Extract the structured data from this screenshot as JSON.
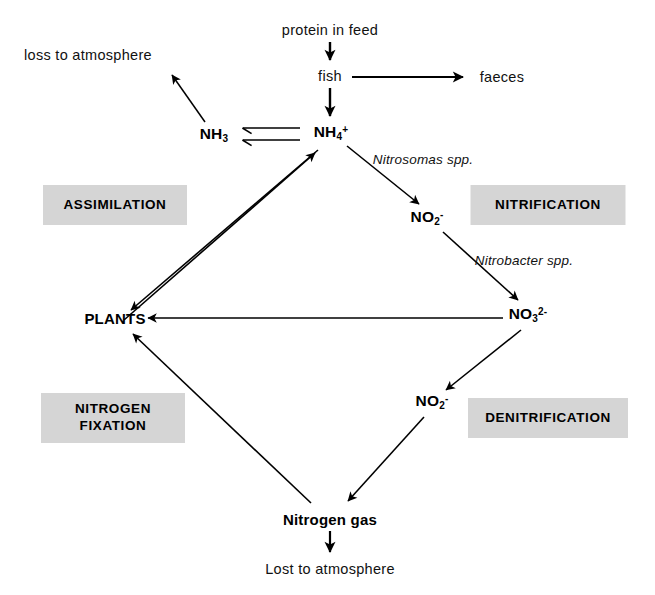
{
  "diagram": {
    "canvas": {
      "width": 655,
      "height": 595
    },
    "colors": {
      "background": "#ffffff",
      "stroke": "#000000",
      "tag_background": "#d5d5d5",
      "text": "#000000"
    },
    "nodes": [
      {
        "id": "protein",
        "label": "protein in feed",
        "x": 330,
        "y": 30,
        "style": "plain"
      },
      {
        "id": "fish",
        "label": "fish",
        "x": 330,
        "y": 76,
        "style": "plain"
      },
      {
        "id": "faeces",
        "label": "faeces",
        "x": 502,
        "y": 77,
        "style": "plain"
      },
      {
        "id": "loss",
        "label": "loss to atmosphere",
        "x": 88,
        "y": 55,
        "style": "plain"
      },
      {
        "id": "nh3",
        "label": "NH3",
        "x": 214,
        "y": 135,
        "style": "chem",
        "sub": "3",
        "sup": ""
      },
      {
        "id": "nh4",
        "label": "NH4+",
        "x": 331,
        "y": 133,
        "style": "chem",
        "sub": "4",
        "sup": "+"
      },
      {
        "id": "no2_top",
        "label": "NO2-",
        "x": 427,
        "y": 218,
        "style": "chem",
        "sub": "2",
        "sup": "-"
      },
      {
        "id": "no3",
        "label": "NO3 2-",
        "x": 528,
        "y": 315,
        "style": "chem",
        "sub": "3",
        "sup": "2-"
      },
      {
        "id": "no2_bottom",
        "label": "NO2-",
        "x": 432,
        "y": 402,
        "style": "chem",
        "sub": "2",
        "sup": "-"
      },
      {
        "id": "plants",
        "label": "PLANTS",
        "x": 115,
        "y": 318,
        "style": "bold"
      },
      {
        "id": "nitrogen_gas",
        "label": "Nitrogen gas",
        "x": 330,
        "y": 519,
        "style": "bold"
      },
      {
        "id": "lost",
        "label": "Lost to atmosphere",
        "x": 330,
        "y": 569,
        "style": "plain"
      }
    ],
    "edge_labels": [
      {
        "id": "nitrosomas",
        "text": "Nitrosomas spp.",
        "x": 423,
        "y": 159
      },
      {
        "id": "nitrobacter",
        "text": "Nitrobacter spp.",
        "x": 524,
        "y": 260
      }
    ],
    "tags": [
      {
        "id": "assimilation",
        "text": "ASSIMILATION",
        "x": 115,
        "y": 205,
        "w": 144,
        "h": 40
      },
      {
        "id": "nitrification",
        "text": "NITRIFICATION",
        "x": 548,
        "y": 205,
        "w": 155,
        "h": 40
      },
      {
        "id": "nitrogen-fixation",
        "text": "NITROGEN\nFIXATION",
        "x": 113,
        "y": 418,
        "w": 144,
        "h": 50
      },
      {
        "id": "denitrification",
        "text": "DENITRIFICATION",
        "x": 548,
        "y": 418,
        "w": 160,
        "h": 40
      }
    ],
    "edges": [
      {
        "id": "protein-to-fish",
        "from": "protein",
        "to": "fish",
        "kind": "arrow",
        "weight": "thick"
      },
      {
        "id": "fish-to-faeces",
        "from": "fish",
        "to": "faeces",
        "kind": "arrow",
        "weight": "thick"
      },
      {
        "id": "fish-to-nh4",
        "from": "fish",
        "to": "nh4",
        "kind": "arrow",
        "weight": "thick"
      },
      {
        "id": "nh3-to-loss",
        "from": "nh3",
        "to": "loss",
        "kind": "arrow",
        "weight": "thin"
      },
      {
        "id": "nh4-to-nh3",
        "from": "nh4",
        "to": "nh3",
        "kind": "arrow",
        "weight": "thin"
      },
      {
        "id": "nh3-to-nh4",
        "from": "nh3",
        "to": "nh4",
        "kind": "arrow",
        "weight": "thin"
      },
      {
        "id": "nh4-to-no2",
        "from": "nh4",
        "to": "no2_top",
        "kind": "arrow",
        "weight": "thin"
      },
      {
        "id": "no2-to-no3",
        "from": "no2_top",
        "to": "no3",
        "kind": "arrow",
        "weight": "thin"
      },
      {
        "id": "no3-to-plants",
        "from": "no3",
        "to": "plants",
        "kind": "arrow",
        "weight": "thin"
      },
      {
        "id": "no3-to-no2b",
        "from": "no3",
        "to": "no2_bottom",
        "kind": "arrow",
        "weight": "thin"
      },
      {
        "id": "no2b-to-nitrogen-gas",
        "from": "no2_bottom",
        "to": "nitrogen_gas",
        "kind": "arrow",
        "weight": "thin"
      },
      {
        "id": "nitrogen-gas-to-plants",
        "from": "nitrogen_gas",
        "to": "plants",
        "kind": "arrow",
        "weight": "thin"
      },
      {
        "id": "nh4-to-plants",
        "from": "nh4",
        "to": "plants",
        "kind": "arrow",
        "weight": "thin"
      },
      {
        "id": "plants-to-nh4",
        "from": "plants",
        "to": "nh4",
        "kind": "arrow",
        "weight": "thin"
      },
      {
        "id": "nitrogen-gas-to-lost",
        "from": "nitrogen_gas",
        "to": "lost",
        "kind": "arrow",
        "weight": "thick"
      }
    ]
  }
}
